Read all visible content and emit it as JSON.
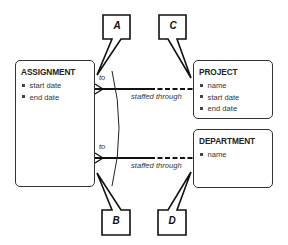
{
  "diagram": {
    "type": "entity-relationship",
    "entities": [
      {
        "name": "ASSIGNMENT",
        "attributes": [
          "start date",
          "end date"
        ]
      },
      {
        "name": "PROJECT",
        "attributes": [
          "name",
          "start date",
          "end date"
        ]
      },
      {
        "name": "DEPARTMENT",
        "attributes": [
          "name"
        ]
      }
    ],
    "relationships": [
      {
        "from": "ASSIGNMENT",
        "to": "PROJECT",
        "near_label": "to",
        "far_label": "staffed through"
      },
      {
        "from": "ASSIGNMENT",
        "to": "DEPARTMENT",
        "near_label": "to",
        "far_label": "staffed through"
      }
    ],
    "callouts": [
      "A",
      "B",
      "C",
      "D"
    ],
    "colors": {
      "line": "#111111",
      "box_border": "#333333",
      "text": "#222222",
      "background": "#ffffff"
    }
  }
}
